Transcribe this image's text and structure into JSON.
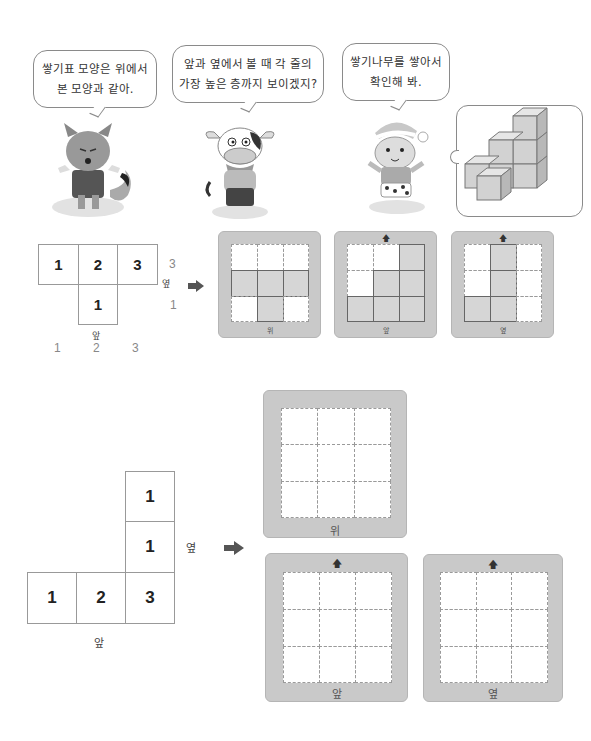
{
  "bubbles": [
    {
      "line1": "쌓기표 모양은 위에서",
      "line2": "본 모양과 같아."
    },
    {
      "line1": "앞과 옆에서 볼 때 각 줄의",
      "line2": "가장 높은 층까지 보이겠지?"
    },
    {
      "line1": "쌓기나무를 쌓아서",
      "line2": "확인해 봐."
    }
  ],
  "characters": [
    "fox",
    "cow",
    "cat"
  ],
  "example": {
    "table": {
      "row1": [
        "1",
        "2",
        "3"
      ],
      "row2": [
        "",
        "1",
        ""
      ]
    },
    "front_label": "앞",
    "side_label": "옆",
    "side_heights": [
      "3",
      "1"
    ],
    "front_heights": [
      "1",
      "2",
      "3"
    ],
    "boards": [
      {
        "caption": "위",
        "filled": [
          [
            0,
            0,
            0
          ],
          [
            1,
            1,
            1
          ],
          [
            0,
            1,
            0
          ]
        ],
        "arrow": false
      },
      {
        "caption": "앞",
        "filled": [
          [
            0,
            0,
            1
          ],
          [
            0,
            1,
            1
          ],
          [
            1,
            1,
            1
          ]
        ],
        "arrow": true
      },
      {
        "caption": "옆",
        "filled": [
          [
            0,
            1,
            0
          ],
          [
            0,
            1,
            0
          ],
          [
            1,
            1,
            0
          ]
        ],
        "arrow": true
      }
    ]
  },
  "exercise": {
    "table": {
      "col3": [
        "1",
        "1"
      ],
      "bottom_row": [
        "1",
        "2",
        "3"
      ]
    },
    "front_label": "앞",
    "side_label": "옆",
    "boards": [
      {
        "caption": "위",
        "arrow": false
      },
      {
        "caption": "앞",
        "arrow": true
      },
      {
        "caption": "옆",
        "arrow": true
      }
    ]
  },
  "symbols": {
    "up_arrow": "🡅",
    "right_arrow": "➡"
  }
}
